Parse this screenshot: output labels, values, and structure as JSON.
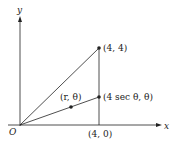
{
  "diagram": {
    "axes": {
      "x_label": "x",
      "y_label": "y",
      "origin_label": "O"
    },
    "points": [
      {
        "id": "p44",
        "label": "(4, 4)"
      },
      {
        "id": "psec",
        "label": "(4 sec θ, θ)"
      },
      {
        "id": "prt",
        "label": "(r, θ)"
      }
    ],
    "tick_labels": {
      "x4": "(4, 0)"
    },
    "colors": {
      "line": "#222222",
      "background": "#ffffff"
    }
  }
}
